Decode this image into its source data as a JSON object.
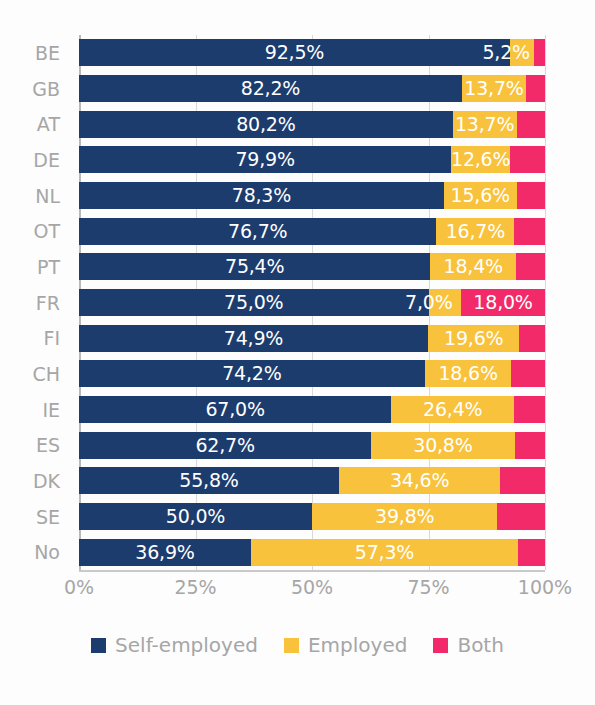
{
  "chart_data": {
    "type": "bar",
    "orientation": "horizontal",
    "stacked": true,
    "normalized": true,
    "title": "",
    "subtitle": "",
    "xlabel": "",
    "ylabel": "",
    "xlim": [
      0,
      100
    ],
    "xticks": [
      0,
      25,
      50,
      75,
      100
    ],
    "xtick_labels": [
      "0%",
      "25%",
      "50%",
      "75%",
      "100%"
    ],
    "grid": true,
    "grid_axis": "x",
    "legend_position": "bottom",
    "categories": [
      "BE",
      "GB",
      "AT",
      "DE",
      "NL",
      "OT",
      "PT",
      "FR",
      "FI",
      "CH",
      "IE",
      "ES",
      "DK",
      "SE",
      "No"
    ],
    "series": [
      {
        "name": "Self-employed",
        "color": "#1d3c6e",
        "values": [
          92.5,
          82.2,
          80.2,
          79.9,
          78.3,
          76.7,
          75.4,
          75.0,
          74.9,
          74.2,
          67.0,
          62.7,
          55.8,
          50.0,
          36.9
        ],
        "labels": [
          "92,5%",
          "82,2%",
          "80,2%",
          "79,9%",
          "78,3%",
          "76,7%",
          "75,4%",
          "75,0%",
          "74,9%",
          "74,2%",
          "67,0%",
          "62,7%",
          "55,8%",
          "50,0%",
          "36,9%"
        ]
      },
      {
        "name": "Employed",
        "color": "#f9c23c",
        "values": [
          5.2,
          13.7,
          13.7,
          12.6,
          15.6,
          16.7,
          18.4,
          7.0,
          19.6,
          18.6,
          26.4,
          30.8,
          34.6,
          39.8,
          57.3
        ],
        "labels": [
          "5,2%",
          "13,7%",
          "13,7%",
          "12,6%",
          "15,6%",
          "16,7%",
          "18,4%",
          "7,0%",
          "19,6%",
          "18,6%",
          "26,4%",
          "30,8%",
          "34,6%",
          "39,8%",
          "57,3%"
        ]
      },
      {
        "name": "Both",
        "color": "#f32a69",
        "values": [
          2.3,
          4.1,
          6.1,
          7.5,
          6.1,
          6.6,
          6.2,
          18.0,
          5.5,
          7.2,
          6.6,
          6.5,
          9.6,
          10.2,
          5.8
        ],
        "labels": [
          "",
          "",
          "",
          "",
          "",
          "",
          "",
          "18,0%",
          "",
          "",
          "",
          "",
          "",
          "",
          ""
        ]
      }
    ]
  },
  "legend": {
    "items": [
      {
        "label": "Self-employed",
        "color": "#1d3c6e"
      },
      {
        "label": "Employed",
        "color": "#f9c23c"
      },
      {
        "label": "Both",
        "color": "#f32a69"
      }
    ]
  }
}
